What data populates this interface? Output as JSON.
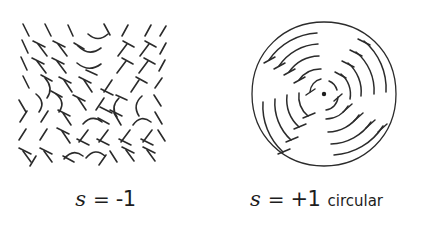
{
  "figure": {
    "background_color": "#ffffff",
    "ink_color": "#2b2b2b",
    "panels": [
      {
        "id": "left",
        "name": "s-minus-one-panel",
        "pattern_type": "crosshatch-nails",
        "caption": {
          "symbol": "s",
          "equals": "=",
          "value": "-1",
          "qualifier": ""
        },
        "description": "Square field of short nail-shaped director marks forming a two-fold saddle (s = -1) disclination",
        "field": {
          "x": 18,
          "y": 20,
          "width": 142,
          "height": 145
        }
      },
      {
        "id": "right",
        "name": "s-plus-one-circular-panel",
        "pattern_type": "concentric-arcs-in-circle",
        "caption": {
          "symbol": "s",
          "equals": "=",
          "value": "+1",
          "qualifier": "circular"
        },
        "description": "Circle containing concentric arc segments with T end-caps around a central point defect (s = +1 circular)",
        "circle": {
          "cx": 113,
          "cy": 94,
          "r": 72
        },
        "center_dot": {
          "cx": 113,
          "cy": 94,
          "r": 2.1
        },
        "arc_radii": [
          14,
          26,
          38,
          50,
          62
        ]
      }
    ]
  }
}
